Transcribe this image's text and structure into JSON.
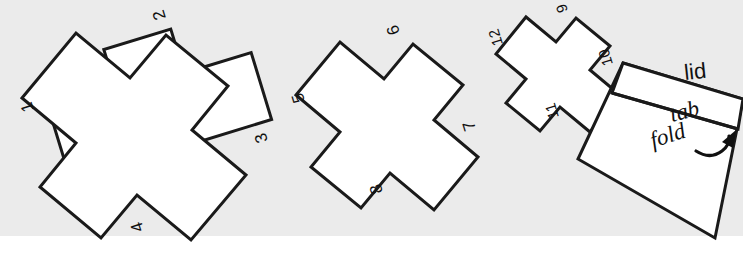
{
  "figure": {
    "background_band_color": "#ebebeb",
    "page_color": "#ffffff",
    "stroke_color": "#1a1a1a"
  },
  "shapes": [
    {
      "id": "cross-large",
      "name": "cross-shape-large",
      "size": "large",
      "rotation_deg": -17,
      "labels": [
        {
          "id": "lbl-1",
          "text": "1",
          "edge": "left"
        },
        {
          "id": "lbl-2",
          "text": "2",
          "edge": "top"
        },
        {
          "id": "lbl-3",
          "text": "3",
          "edge": "right"
        },
        {
          "id": "lbl-4",
          "text": "4",
          "edge": "bottom"
        }
      ]
    },
    {
      "id": "cross-medium",
      "name": "cross-shape-medium",
      "size": "medium",
      "rotation_deg": -17,
      "labels": [
        {
          "id": "lbl-5",
          "text": "5",
          "edge": "left"
        },
        {
          "id": "lbl-6",
          "text": "6",
          "edge": "top"
        },
        {
          "id": "lbl-7",
          "text": "7",
          "edge": "right"
        },
        {
          "id": "lbl-8",
          "text": "8",
          "edge": "bottom"
        }
      ]
    },
    {
      "id": "cross-small",
      "name": "cross-shape-small",
      "size": "small",
      "rotation_deg": -17,
      "labels": [
        {
          "id": "lbl-9",
          "text": "9",
          "edge": "top"
        },
        {
          "id": "lbl-10",
          "text": "10",
          "edge": "right"
        },
        {
          "id": "lbl-11",
          "text": "11",
          "edge": "bottom"
        },
        {
          "id": "lbl-12",
          "text": "12",
          "edge": "left"
        }
      ]
    },
    {
      "id": "lid-box",
      "name": "lid-box-shape",
      "size": "box",
      "rotation_deg": -17,
      "labels": [
        {
          "id": "lbl-lid",
          "text": "lid",
          "edge": "outside-top"
        },
        {
          "id": "lbl-tab",
          "text": "tab",
          "edge": "tab-strip"
        },
        {
          "id": "lbl-fold",
          "text": "fold",
          "edge": "fold-line"
        }
      ]
    }
  ],
  "annotations": {
    "lid": "lid",
    "tab": "tab",
    "fold": "fold",
    "fold_arrow": "curved-fold-arrow"
  },
  "numbers": {
    "n1": "1",
    "n2": "2",
    "n3": "3",
    "n4": "4",
    "n5": "5",
    "n6": "6",
    "n7": "7",
    "n8": "8",
    "n9": "9",
    "n10": "10",
    "n11": "11",
    "n12": "12"
  }
}
